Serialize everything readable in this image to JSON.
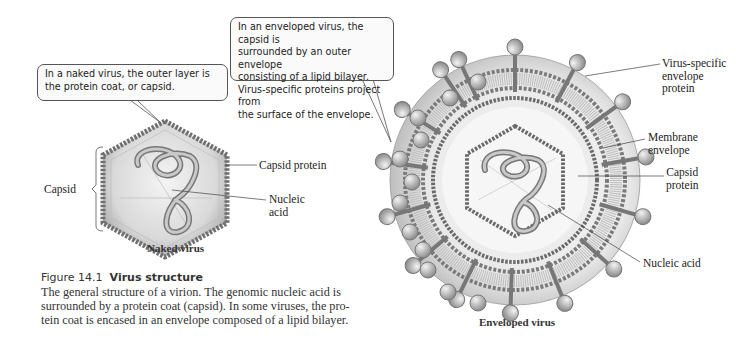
{
  "figure": {
    "number": "Figure 14.1",
    "title": "Virus structure",
    "caption": "The general structure of a virion. The genomic nucleic acid is surrounded by a protein coat (capsid). In some viruses, the protein coat is encased in an envelope composed of a lipid bilayer.",
    "caption_lines": [
      "The general structure of a virion. The genomic nucleic acid is",
      "surrounded by a protein coat (capsid). In some viruses, the pro-",
      "tein coat is encased in an envelope composed of a lipid bilayer."
    ]
  },
  "naked_virus": {
    "callout": "In a naked virus, the outer layer is\nthe protein coat, or capsid.",
    "subtitle": "Naked virus",
    "labels": {
      "capsid": "Capsid",
      "capsid_protein": "Capsid protein",
      "nucleic_acid": "Nucleic\nacid"
    }
  },
  "enveloped_virus": {
    "callout": "In an enveloped virus, the capsid is\nsurrounded by an outer envelope\nconsisting of a lipid bilayer.\nVirus-specific proteins project from\nthe surface of the envelope.",
    "subtitle": "Enveloped virus",
    "labels": {
      "envelope_protein": "Virus-specific\nenvelope protein",
      "membrane_envelope": "Membrane\nenvelope",
      "capsid_protein": "Capsid\nprotein",
      "nucleic_acid": "Nucleic acid"
    }
  },
  "colors": {
    "capsid_dots": "#6f6f6f",
    "body_gray": "#cfcfcf",
    "leader_line": "#444444"
  }
}
